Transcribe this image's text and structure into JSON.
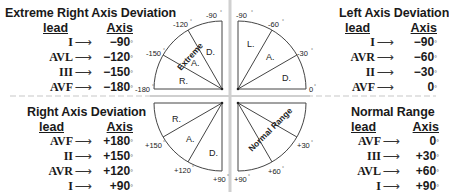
{
  "panels": {
    "extreme_right": {
      "title": "Extreme Right Axis Deviation",
      "header_lead": "lead",
      "header_axis": "Axis",
      "rows": [
        {
          "lead": "I",
          "axis": "−90"
        },
        {
          "lead": "AVL",
          "axis": "−120"
        },
        {
          "lead": "III",
          "axis": "−150"
        },
        {
          "lead": "AVF",
          "axis": "−180"
        }
      ]
    },
    "left": {
      "title": "Left Axis Deviation",
      "header_lead": "lead",
      "header_axis": "Axis",
      "rows": [
        {
          "lead": "I",
          "axis": "−90"
        },
        {
          "lead": "AVR",
          "axis": "−60"
        },
        {
          "lead": "II",
          "axis": "−30"
        },
        {
          "lead": "AVF",
          "axis": "0"
        }
      ]
    },
    "right": {
      "title": "Right Axis Deviation",
      "header_lead": "lead",
      "header_axis": "Axis",
      "rows": [
        {
          "lead": "AVF",
          "axis": "+180"
        },
        {
          "lead": "II",
          "axis": "+150"
        },
        {
          "lead": "AVR",
          "axis": "+120"
        },
        {
          "lead": "I",
          "axis": "+90"
        }
      ]
    },
    "normal": {
      "title": "Normal Range",
      "header_lead": "lead",
      "header_axis": "Axis",
      "rows": [
        {
          "lead": "AVF",
          "axis": "0"
        },
        {
          "lead": "III",
          "axis": "+30"
        },
        {
          "lead": "AVL",
          "axis": "+60"
        },
        {
          "lead": "I",
          "axis": "+90"
        }
      ]
    }
  },
  "arrow_glyph": "⟶",
  "degree_glyph": "°",
  "diagram": {
    "top_left": {
      "ticks": [
        "-90",
        "-120",
        "-150",
        "-180"
      ],
      "sectors": [
        "D.",
        "A.",
        "R."
      ],
      "rotated_label": "Extreme"
    },
    "top_right": {
      "ticks": [
        "-90",
        "-60",
        "-30",
        "0"
      ],
      "sectors": [
        "L.",
        "A.",
        "D."
      ]
    },
    "bottom_left": {
      "ticks": [
        "+150",
        "+120",
        "+90"
      ],
      "sectors": [
        "R.",
        "A.",
        "D."
      ]
    },
    "bottom_right": {
      "ticks": [
        "+90",
        "+60",
        "+30"
      ],
      "rotated_label": "Normal Range"
    },
    "line_color": "#444444",
    "divider_color": "#c8c8c8"
  }
}
